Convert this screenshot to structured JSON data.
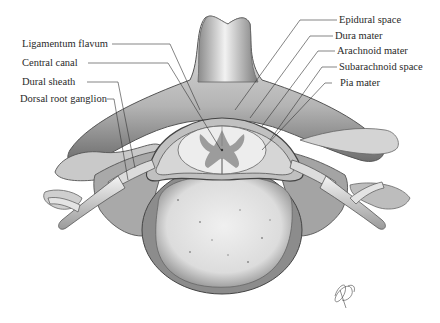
{
  "figure": {
    "labels_left": [
      {
        "id": "ligamentum-flavum",
        "text": "Ligamentum flavum"
      },
      {
        "id": "central-canal",
        "text": "Central canal"
      },
      {
        "id": "dural-sheath",
        "text": "Dural sheath"
      },
      {
        "id": "dorsal-root-ganglion",
        "text": "Dorsal root ganglion"
      }
    ],
    "labels_right": [
      {
        "id": "epidural-space",
        "text": "Epidural space"
      },
      {
        "id": "dura-mater",
        "text": "Dura mater"
      },
      {
        "id": "arachnoid-mater",
        "text": "Arachnoid mater"
      },
      {
        "id": "subarachnoid-space",
        "text": "Subarachnoid space"
      },
      {
        "id": "pia-mater",
        "text": "Pia mater"
      }
    ],
    "colors": {
      "bone_light": "#e4e4e4",
      "bone_mid": "#a8a8a8",
      "bone_dark": "#5a5a5a",
      "gray_matter": "#9a9a9a",
      "leader_line": "#333333"
    }
  }
}
